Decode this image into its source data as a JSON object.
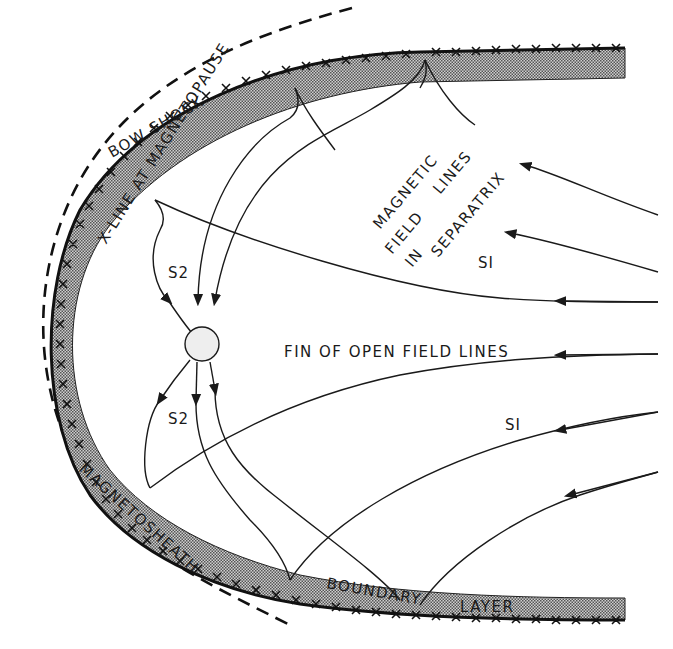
{
  "diagram": {
    "type": "magnetosphere cross-section schematic",
    "colors": {
      "ink": "#1a1a1a",
      "background": "#ffffff",
      "boundary_layer_fill": "#a8a8a8"
    },
    "labels": {
      "bow_shock": "BOW SHOCK",
      "x_line": "X-LINE AT MAGNETOPAUSE",
      "magnetic": "MAGNETIC",
      "field": "FIELD",
      "lines": "LINES",
      "in": "IN",
      "separatrix": "SEPARATRIX",
      "dash": "-",
      "s1_upper": "SI",
      "s1_lower": "SI",
      "s2_upper": "S2",
      "s2_lower": "S2",
      "fin": "FIN OF OPEN FIELD LINES",
      "magnetosheath": "MAGNETOSHEATH",
      "boundary": "BOUNDARY",
      "layer": "LAYER"
    },
    "structures": [
      {
        "name": "bow-shock",
        "style": "dashed curve"
      },
      {
        "name": "magnetopause",
        "style": "solid curve with X-marks (X-line)"
      },
      {
        "name": "boundary-layer",
        "style": "stippled band inside magnetopause"
      },
      {
        "name": "neutral-point",
        "style": "small circle where S2 separatrices converge"
      },
      {
        "name": "field-lines",
        "style": "arrowed curves flowing leftward"
      }
    ]
  }
}
